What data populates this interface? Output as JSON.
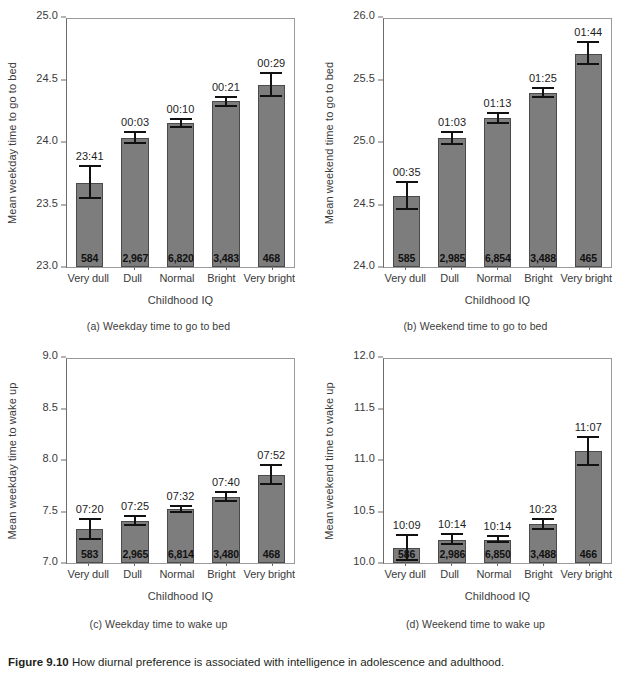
{
  "figure": {
    "caption_lead": "Figure 9.10",
    "caption_text": "How diurnal preference is associated with intelligence in adolescence and adulthood."
  },
  "chart_data": [
    {
      "id": "panel-a",
      "type": "bar",
      "title": "(a) Weekday time to go to bed",
      "xlabel": "Childhood IQ",
      "ylabel": "Mean weekday time to go to bed",
      "ylim": [
        23.0,
        25.0
      ],
      "yticks": [
        "23.0",
        "23.5",
        "24.0",
        "24.5",
        "25.0"
      ],
      "ytick_values": [
        23.0,
        23.5,
        24.0,
        24.5,
        25.0
      ],
      "grid": false,
      "legend": "none",
      "categories": [
        "Very dull",
        "Dull",
        "Normal",
        "Bright",
        "Very bright"
      ],
      "values": [
        23.68,
        24.04,
        24.16,
        24.34,
        24.47
      ],
      "err_low": [
        23.55,
        23.99,
        24.12,
        24.29,
        24.37
      ],
      "err_high": [
        23.82,
        24.1,
        24.2,
        24.38,
        24.57
      ],
      "point_labels": [
        "23:41",
        "00:03",
        "00:10",
        "00:21",
        "00:29"
      ],
      "n_labels": [
        "584",
        "2,967",
        "6,820",
        "3,483",
        "468"
      ]
    },
    {
      "id": "panel-b",
      "type": "bar",
      "title": "(b) Weekend time to go to bed",
      "xlabel": "Childhood IQ",
      "ylabel": "Mean weekend time to go to bed",
      "ylim": [
        24.0,
        26.0
      ],
      "yticks": [
        "24.0",
        "24.5",
        "25.0",
        "25.5",
        "26.0"
      ],
      "ytick_values": [
        24.0,
        24.5,
        25.0,
        25.5,
        26.0
      ],
      "grid": false,
      "legend": "none",
      "categories": [
        "Very dull",
        "Dull",
        "Normal",
        "Bright",
        "Very bright"
      ],
      "values": [
        24.57,
        25.04,
        25.2,
        25.4,
        25.72
      ],
      "err_low": [
        24.46,
        24.98,
        25.15,
        25.36,
        25.63
      ],
      "err_high": [
        24.69,
        25.1,
        25.25,
        25.45,
        25.82
      ],
      "point_labels": [
        "00:35",
        "01:03",
        "01:13",
        "01:25",
        "01:44"
      ],
      "n_labels": [
        "585",
        "2,985",
        "6,854",
        "3,488",
        "465"
      ]
    },
    {
      "id": "panel-c",
      "type": "bar",
      "title": "(c) Weekday time to wake up",
      "xlabel": "Childhood IQ",
      "ylabel": "Mean weekday time to wake up",
      "ylim": [
        7.0,
        9.0
      ],
      "yticks": [
        "7.0",
        "7.5",
        "8.0",
        "8.5",
        "9.0"
      ],
      "ytick_values": [
        7.0,
        7.5,
        8.0,
        8.5,
        9.0
      ],
      "grid": false,
      "legend": "none",
      "categories": [
        "Very dull",
        "Dull",
        "Normal",
        "Bright",
        "Very bright"
      ],
      "values": [
        7.33,
        7.41,
        7.53,
        7.65,
        7.86
      ],
      "err_low": [
        7.23,
        7.36,
        7.49,
        7.6,
        7.76
      ],
      "err_high": [
        7.44,
        7.47,
        7.57,
        7.71,
        7.97
      ],
      "point_labels": [
        "07:20",
        "07:25",
        "07:32",
        "07:40",
        "07:52"
      ],
      "n_labels": [
        "583",
        "2,965",
        "6,814",
        "3,480",
        "468"
      ]
    },
    {
      "id": "panel-d",
      "type": "bar",
      "title": "(d) Weekend time to wake up",
      "xlabel": "Childhood IQ",
      "ylabel": "Mean weekend time to wake up",
      "ylim": [
        10.0,
        12.0
      ],
      "yticks": [
        "10.0",
        "10.5",
        "11.0",
        "11.5",
        "12.0"
      ],
      "ytick_values": [
        10.0,
        10.5,
        11.0,
        11.5,
        12.0
      ],
      "grid": false,
      "legend": "none",
      "categories": [
        "Very dull",
        "Dull",
        "Normal",
        "Bright",
        "Very bright"
      ],
      "values": [
        10.15,
        10.23,
        10.23,
        10.38,
        11.1
      ],
      "err_low": [
        10.02,
        10.18,
        10.2,
        10.32,
        10.95
      ],
      "err_high": [
        10.28,
        10.29,
        10.27,
        10.44,
        11.25
      ],
      "point_labels": [
        "10:09",
        "10:14",
        "10:14",
        "10:23",
        "11:07"
      ],
      "n_labels": [
        "586",
        "2,986",
        "6,850",
        "3,488",
        "466"
      ]
    }
  ]
}
